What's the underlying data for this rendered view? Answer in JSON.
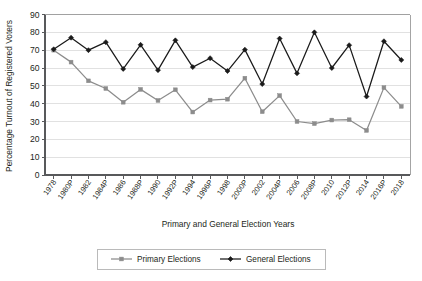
{
  "chart_data": {
    "type": "line",
    "title": "",
    "xlabel": "Primary and General Election Years",
    "ylabel": "Percentage Turnout of Registered Voters",
    "ylim": [
      0,
      90
    ],
    "ytick_step": 10,
    "yticks": [
      0,
      10,
      20,
      30,
      40,
      50,
      60,
      70,
      80,
      90
    ],
    "grid": true,
    "legend_position": "bottom",
    "categories": [
      "1978",
      "1980P",
      "1982",
      "1984P",
      "1986",
      "1988P",
      "1990",
      "1992P",
      "1994",
      "1996P",
      "1998",
      "2000P",
      "2002",
      "2004P",
      "2006",
      "2008P",
      "2010",
      "2012P",
      "2014",
      "2016P",
      "2018"
    ],
    "series": [
      {
        "name": "Primary Elections",
        "color": "#8c8c8c",
        "marker": "square",
        "values": [
          70.0,
          63.3,
          52.8,
          48.5,
          40.8,
          48.0,
          41.8,
          47.8,
          35.3,
          42.0,
          42.5,
          54.3,
          35.5,
          44.5,
          30.0,
          28.8,
          30.8,
          31.0,
          25.0,
          49.0,
          38.5
        ]
      },
      {
        "name": "General Elections",
        "color": "#1a1a1a",
        "marker": "diamond",
        "values": [
          70.5,
          77.0,
          70.0,
          74.5,
          59.5,
          73.0,
          58.8,
          75.5,
          60.5,
          65.5,
          58.3,
          70.3,
          51.0,
          76.5,
          57.0,
          80.0,
          60.0,
          72.8,
          44.0,
          75.0,
          64.5
        ]
      }
    ]
  },
  "legend": {
    "entries": [
      {
        "label": "Primary Elections"
      },
      {
        "label": "General Elections"
      }
    ]
  }
}
